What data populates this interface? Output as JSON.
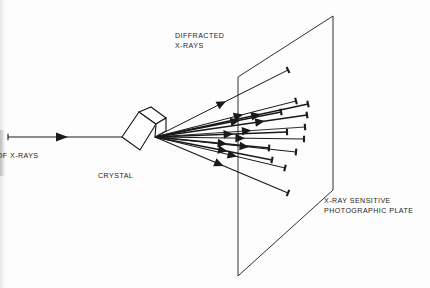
{
  "figure": {
    "background_color": "#fdfdfd",
    "ink_color": "#1a1a1a"
  },
  "labels": {
    "diffracted_xrays": "DIFFRACTED\nX-RAYS",
    "crystal": "CRYSTAL",
    "beam_of_xrays": "M OF X-RAYS",
    "photographic_plate": "X-RAY SENSITIVE\nPHOTOGRAPHIC PLATE"
  },
  "diagram": {
    "incident_beam": {
      "from_x": 8,
      "from_y": 137,
      "to_x": 122,
      "to_y": 137,
      "arrow_at_x": 60,
      "cap_at_start": true
    },
    "crystal": {
      "face_points": "122,137 139,112 156,124 140,150",
      "top_points": "139,112 151,107 166,118 156,124",
      "right_points": "156,124 166,118 166,131 155,137"
    },
    "source_point": {
      "x": 155,
      "y": 137
    },
    "plate": {
      "corners": "238,77 333,16 333,190 238,276",
      "left_edge_top_x": 238,
      "left_edge_top_y": 77,
      "left_edge_bottom_x": 238,
      "left_edge_bottom_y": 276
    },
    "rays": [
      {
        "id": "ray-1",
        "end_x": 288,
        "end_y": 70,
        "arrow_t": 0.47,
        "weight": 1.0
      },
      {
        "id": "ray-2",
        "end_x": 296,
        "end_y": 101,
        "arrow_t": 0.56,
        "weight": 1.0
      },
      {
        "id": "ray-3",
        "end_x": 308,
        "end_y": 104,
        "arrow_t": 0.63,
        "weight": 1.3
      },
      {
        "id": "ray-4",
        "end_x": 281,
        "end_y": 112,
        "arrow_t": 0.6,
        "weight": 1.7
      },
      {
        "id": "ray-5",
        "end_x": 307,
        "end_y": 115,
        "arrow_t": 0.66,
        "weight": 1.3
      },
      {
        "id": "ray-6",
        "end_x": 305,
        "end_y": 127,
        "arrow_t": 0.58,
        "weight": 0.9
      },
      {
        "id": "ray-7",
        "end_x": 287,
        "end_y": 132,
        "arrow_t": 0.52,
        "weight": 1.6
      },
      {
        "id": "ray-8",
        "end_x": 304,
        "end_y": 139,
        "arrow_t": 0.54,
        "weight": 1.0
      },
      {
        "id": "ray-9",
        "end_x": 269,
        "end_y": 148,
        "arrow_t": 0.55,
        "weight": 1.4
      },
      {
        "id": "ray-10",
        "end_x": 296,
        "end_y": 152,
        "arrow_t": 0.6,
        "weight": 1.0
      },
      {
        "id": "ray-11",
        "end_x": 272,
        "end_y": 160,
        "arrow_t": 0.54,
        "weight": 1.5
      },
      {
        "id": "ray-12",
        "end_x": 285,
        "end_y": 168,
        "arrow_t": 0.56,
        "weight": 1.0
      },
      {
        "id": "ray-13",
        "end_x": 288,
        "end_y": 193,
        "arrow_t": 0.45,
        "weight": 1.3
      }
    ]
  }
}
